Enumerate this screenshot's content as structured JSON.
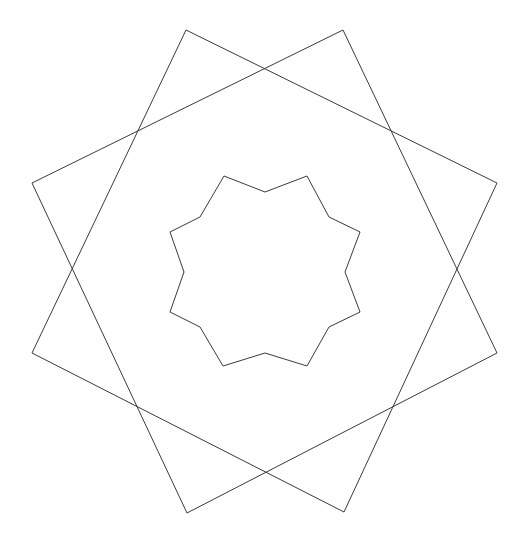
{
  "canvas": {
    "width": 529,
    "height": 545,
    "background_color": "#ffffff",
    "stroke_color": "#3a3a3a",
    "stroke_width": 1,
    "center_x": 264.5,
    "center_y": 271.5
  },
  "figure": {
    "title": ""
  },
  "chart_data": {
    "type": "scatter",
    "title": "",
    "subtitle": "",
    "xlabel": "",
    "ylabel": "",
    "xlim": [
      0,
      529
    ],
    "ylim": [
      545,
      0
    ],
    "grid": false,
    "legend": "none",
    "shapes": [
      {
        "name": "outer-square-a",
        "kind": "polygon",
        "sides": 4,
        "closed": true,
        "center": [
          264.5,
          271.5
        ],
        "circumradius": 265,
        "rotation_deg": -13,
        "points": [
          [
            186,
            30
          ],
          [
            497,
            183
          ],
          [
            344,
            512
          ],
          [
            32,
            353
          ]
        ]
      },
      {
        "name": "outer-square-b",
        "kind": "polygon",
        "sides": 4,
        "closed": true,
        "center": [
          264.5,
          271.5
        ],
        "circumradius": 265,
        "rotation_deg": 13,
        "points": [
          [
            343,
            30
          ],
          [
            497,
            353
          ],
          [
            187,
            513
          ],
          [
            32,
            183
          ]
        ]
      },
      {
        "name": "inner-star",
        "kind": "star-polygon",
        "points_count": 8,
        "closed": true,
        "center": [
          264.5,
          271.5
        ],
        "outer_radius": 96,
        "inner_radius": 82,
        "rotation_deg": 22.5,
        "points": [
          [
            224,
            176
          ],
          [
            265,
            192
          ],
          [
            307,
            176
          ],
          [
            329,
            217
          ],
          [
            360,
            232
          ],
          [
            345,
            272
          ],
          [
            360,
            312
          ],
          [
            329,
            327
          ],
          [
            307,
            366
          ],
          [
            265,
            353
          ],
          [
            223,
            366
          ],
          [
            200,
            327
          ],
          [
            170,
            312
          ],
          [
            184,
            272
          ],
          [
            170,
            232
          ],
          [
            200,
            217
          ]
        ]
      }
    ]
  }
}
